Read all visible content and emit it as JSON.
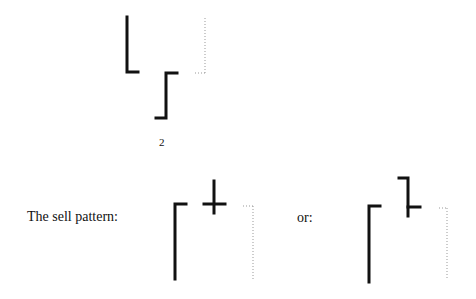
{
  "figure_number": "2",
  "sell_label": "The sell pattern:",
  "or_label": "or:",
  "colors": {
    "stroke": "#111111",
    "dotted": "#999999"
  }
}
